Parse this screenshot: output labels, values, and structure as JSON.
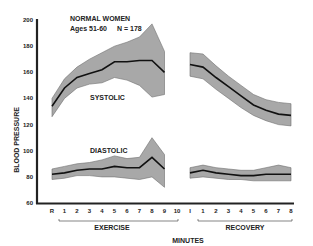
{
  "chart_data": {
    "type": "area",
    "title": "NORMAL WOMEN",
    "subtitle": "Ages 51-60",
    "annotation_n": "N = 178",
    "xlabel": "MINUTES",
    "ylabel": "BLOOD PRESSURE",
    "ylim": [
      60,
      200
    ],
    "yticks": [
      60,
      80,
      100,
      120,
      140,
      160,
      180,
      200
    ],
    "grid": false,
    "legend": "none",
    "x_groups": [
      {
        "name": "EXERCISE",
        "categories": [
          "R",
          "1",
          "2",
          "3",
          "4",
          "5",
          "6",
          "7",
          "8",
          "9",
          "10"
        ]
      },
      {
        "name": "RECOVERY",
        "categories": [
          "I",
          "1",
          "2",
          "3",
          "4",
          "5",
          "6",
          "7",
          "8"
        ]
      }
    ],
    "series": [
      {
        "name": "SYSTOLIC",
        "phase": "exercise",
        "x": [
          "R",
          "1",
          "2",
          "3",
          "4",
          "5",
          "6",
          "7",
          "8",
          "9"
        ],
        "mean": [
          134,
          148,
          156,
          159,
          162,
          168,
          168,
          169,
          169,
          160
        ],
        "upper": [
          140,
          155,
          164,
          170,
          175,
          180,
          183,
          187,
          197,
          176
        ],
        "lower": [
          126,
          140,
          148,
          151,
          152,
          156,
          154,
          150,
          141,
          143
        ]
      },
      {
        "name": "SYSTOLIC",
        "phase": "recovery",
        "x": [
          "I",
          "1",
          "2",
          "3",
          "4",
          "5",
          "6",
          "7",
          "8"
        ],
        "mean": [
          166,
          164,
          156,
          149,
          142,
          135,
          131,
          128,
          127
        ],
        "upper": [
          175,
          174,
          165,
          157,
          150,
          143,
          139,
          137,
          136
        ],
        "lower": [
          157,
          155,
          147,
          140,
          133,
          127,
          123,
          120,
          119
        ]
      },
      {
        "name": "DIASTOLIC",
        "phase": "exercise",
        "x": [
          "R",
          "1",
          "2",
          "3",
          "4",
          "5",
          "6",
          "7",
          "8",
          "9"
        ],
        "mean": [
          82,
          83,
          85,
          86,
          86,
          88,
          87,
          87,
          95,
          86
        ],
        "upper": [
          86,
          88,
          90,
          91,
          93,
          96,
          94,
          95,
          110,
          97
        ],
        "lower": [
          78,
          79,
          81,
          81,
          80,
          80,
          79,
          78,
          80,
          72
        ]
      },
      {
        "name": "DIASTOLIC",
        "phase": "recovery",
        "x": [
          "I",
          "1",
          "2",
          "3",
          "4",
          "5",
          "6",
          "7",
          "8"
        ],
        "mean": [
          83,
          85,
          83,
          82,
          81,
          81,
          82,
          82,
          82
        ],
        "upper": [
          87,
          89,
          87,
          86,
          85,
          85,
          87,
          89,
          87
        ],
        "lower": [
          79,
          80,
          79,
          78,
          78,
          77,
          77,
          77,
          77
        ]
      }
    ]
  },
  "labels": {
    "title": "NORMAL WOMEN",
    "ages": "Ages  51-60",
    "n": "N  =  178",
    "systolic": "SYSTOLIC",
    "diastolic": "DIASTOLIC",
    "ylabel": "BLOOD PRESSURE",
    "xlabel": "MINUTES",
    "exercise": "EXERCISE",
    "recovery": "RECOVERY"
  },
  "style": {
    "band_color": "#9a9a9a",
    "line_color": "#111111",
    "axis_color": "#222222"
  }
}
